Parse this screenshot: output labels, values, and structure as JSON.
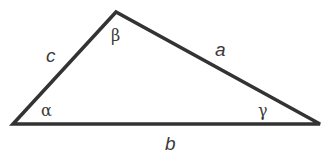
{
  "diagram": {
    "type": "triangle",
    "stroke_color": "#333333",
    "background": "#ffffff",
    "vertices": {
      "A": {
        "x": 13,
        "y": 124,
        "angle_label": "α"
      },
      "B": {
        "x": 116,
        "y": 12,
        "angle_label": "β"
      },
      "C": {
        "x": 320,
        "y": 124,
        "angle_label": "γ"
      }
    },
    "sides": {
      "a": {
        "label": "a",
        "between": [
          "B",
          "C"
        ]
      },
      "b": {
        "label": "b",
        "between": [
          "A",
          "C"
        ]
      },
      "c": {
        "label": "c",
        "between": [
          "A",
          "B"
        ]
      }
    },
    "labels": {
      "side_a": "a",
      "side_b": "b",
      "side_c": "c",
      "angle_alpha": "α",
      "angle_beta": "β",
      "angle_gamma": "γ"
    }
  }
}
